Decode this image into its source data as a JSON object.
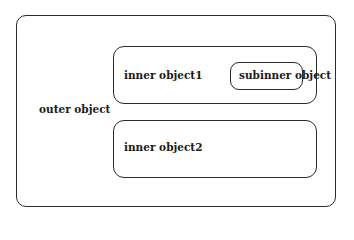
{
  "diagram": {
    "type": "nested-containment",
    "outer": {
      "label": "outer object"
    },
    "inner1": {
      "label": "inner object1"
    },
    "subinner": {
      "label": "subinner object"
    },
    "inner2": {
      "label": "inner object2"
    },
    "colors": {
      "stroke": "#2a2a2a",
      "text": "#1a1a1a",
      "background": "#ffffff"
    }
  }
}
